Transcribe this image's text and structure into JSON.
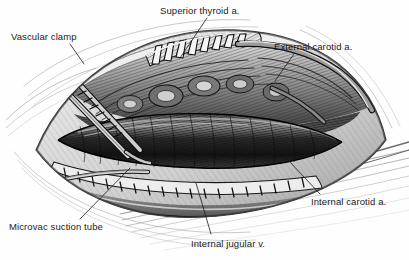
{
  "figure": {
    "style": "grayscale-line-drawing",
    "width": 409,
    "height": 260,
    "background_color": "#fefefe",
    "ink_color": "#1b1b1b"
  },
  "labels": [
    {
      "id": "vascular-clamp",
      "text": "Vascular clamp",
      "x": 11,
      "y": 31,
      "leader": {
        "x1": 70,
        "y1": 44,
        "x2": 84,
        "y2": 64
      }
    },
    {
      "id": "superior-thyroid-artery",
      "text": "Superior thyroid a.",
      "x": 160,
      "y": 5,
      "leader": {
        "x1": 207,
        "y1": 18,
        "x2": 180,
        "y2": 58
      }
    },
    {
      "id": "external-carotid-artery",
      "text": "External carotid a.",
      "x": 274,
      "y": 41,
      "leader": {
        "x1": 294,
        "y1": 54,
        "x2": 275,
        "y2": 81
      }
    },
    {
      "id": "internal-carotid-artery",
      "text": "Internal carotid a.",
      "x": 311,
      "y": 196,
      "leader": {
        "x1": 320,
        "y1": 194,
        "x2": 289,
        "y2": 161
      }
    },
    {
      "id": "internal-jugular-vein",
      "text": "Internal jugular v.",
      "x": 191,
      "y": 238,
      "leader": {
        "x1": 211,
        "y1": 234,
        "x2": 196,
        "y2": 183
      }
    },
    {
      "id": "microvac-suction-tube",
      "text": "Microvac suction tube",
      "x": 9,
      "y": 221,
      "leader": {
        "x1": 80,
        "y1": 219,
        "x2": 130,
        "y2": 168
      }
    }
  ]
}
